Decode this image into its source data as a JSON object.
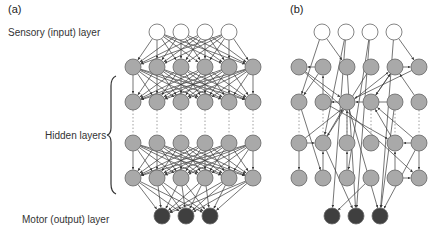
{
  "labels": {
    "panel_a": "(a)",
    "panel_b": "(b)",
    "input_layer": "Sensory (input) layer",
    "hidden_layers": "Hidden layers",
    "output_layer": "Motor (output) layer"
  },
  "colors": {
    "input_fill": "#ffffff",
    "hidden_fill": "#a9a9a9",
    "output_fill": "#3f3f3f",
    "node_stroke": "#666666",
    "edge": "#3a3a3a",
    "dotted": "#888888"
  },
  "panel_a": {
    "type": "fully-connected feedforward network",
    "nodes": {
      "input": [
        [
          157,
          32
        ],
        [
          181,
          32
        ],
        [
          205,
          32
        ],
        [
          229,
          32
        ]
      ],
      "hidden": [
        [
          [
            133,
            67
          ],
          [
            157,
            67
          ],
          [
            181,
            67
          ],
          [
            205,
            67
          ],
          [
            229,
            67
          ],
          [
            253,
            67
          ]
        ],
        [
          [
            133,
            102
          ],
          [
            157,
            102
          ],
          [
            181,
            102
          ],
          [
            205,
            102
          ],
          [
            229,
            102
          ],
          [
            253,
            102
          ]
        ],
        [
          [
            133,
            143
          ],
          [
            157,
            143
          ],
          [
            181,
            143
          ],
          [
            205,
            143
          ],
          [
            229,
            143
          ],
          [
            253,
            143
          ]
        ],
        [
          [
            133,
            178
          ],
          [
            157,
            178
          ],
          [
            181,
            178
          ],
          [
            205,
            178
          ],
          [
            229,
            178
          ],
          [
            253,
            178
          ]
        ]
      ],
      "output": [
        [
          162,
          216
        ],
        [
          186,
          216
        ],
        [
          210,
          216
        ]
      ]
    }
  },
  "panel_b": {
    "type": "sparse recurrent network",
    "nodes": {
      "input": [
        [
          322,
          32
        ],
        [
          346,
          32
        ],
        [
          370,
          32
        ],
        [
          394,
          32
        ]
      ],
      "hidden": [
        [
          [
            299,
            67
          ],
          [
            323,
            67
          ],
          [
            347,
            67
          ],
          [
            371,
            67
          ],
          [
            395,
            67
          ],
          [
            419,
            67
          ]
        ],
        [
          [
            299,
            102
          ],
          [
            323,
            102
          ],
          [
            347,
            102
          ],
          [
            371,
            102
          ],
          [
            395,
            102
          ],
          [
            419,
            102
          ]
        ],
        [
          [
            299,
            143
          ],
          [
            323,
            143
          ],
          [
            347,
            143
          ],
          [
            371,
            143
          ],
          [
            395,
            143
          ],
          [
            419,
            143
          ]
        ],
        [
          [
            299,
            178
          ],
          [
            323,
            178
          ],
          [
            347,
            178
          ],
          [
            371,
            178
          ],
          [
            395,
            178
          ],
          [
            419,
            178
          ]
        ]
      ],
      "output": [
        [
          332,
          216
        ],
        [
          356,
          216
        ],
        [
          380,
          216
        ]
      ]
    },
    "edges": [
      [
        322,
        32,
        299,
        102
      ],
      [
        322,
        32,
        347,
        67
      ],
      [
        346,
        32,
        323,
        143
      ],
      [
        346,
        32,
        332,
        216
      ],
      [
        370,
        32,
        347,
        178
      ],
      [
        370,
        32,
        356,
        216
      ],
      [
        394,
        32,
        419,
        67
      ],
      [
        394,
        32,
        380,
        216
      ],
      [
        323,
        67,
        299,
        67
      ],
      [
        395,
        67,
        419,
        67
      ],
      [
        299,
        67,
        347,
        102
      ],
      [
        323,
        67,
        299,
        102
      ],
      [
        323,
        102,
        323,
        67
      ],
      [
        347,
        67,
        356,
        216
      ],
      [
        371,
        67,
        323,
        143
      ],
      [
        419,
        67,
        347,
        102
      ],
      [
        395,
        67,
        371,
        102
      ],
      [
        347,
        102,
        323,
        102
      ],
      [
        395,
        102,
        347,
        102
      ],
      [
        299,
        67,
        419,
        178
      ],
      [
        419,
        102,
        395,
        67
      ],
      [
        299,
        102,
        323,
        178
      ],
      [
        371,
        102,
        395,
        67
      ],
      [
        347,
        102,
        380,
        216
      ],
      [
        323,
        102,
        395,
        143
      ],
      [
        395,
        102,
        380,
        216
      ],
      [
        299,
        143,
        323,
        143
      ],
      [
        419,
        143,
        395,
        143
      ],
      [
        299,
        143,
        299,
        178
      ],
      [
        419,
        143,
        419,
        178
      ],
      [
        323,
        143,
        347,
        102
      ],
      [
        299,
        143,
        395,
        67
      ],
      [
        323,
        178,
        323,
        143
      ],
      [
        395,
        178,
        395,
        143
      ],
      [
        347,
        143,
        347,
        102
      ],
      [
        419,
        143,
        371,
        102
      ],
      [
        395,
        178,
        419,
        178
      ],
      [
        371,
        178,
        332,
        216
      ],
      [
        323,
        143,
        356,
        216
      ],
      [
        419,
        143,
        380,
        216
      ],
      [
        347,
        178,
        347,
        143
      ],
      [
        395,
        143,
        371,
        102
      ]
    ]
  }
}
